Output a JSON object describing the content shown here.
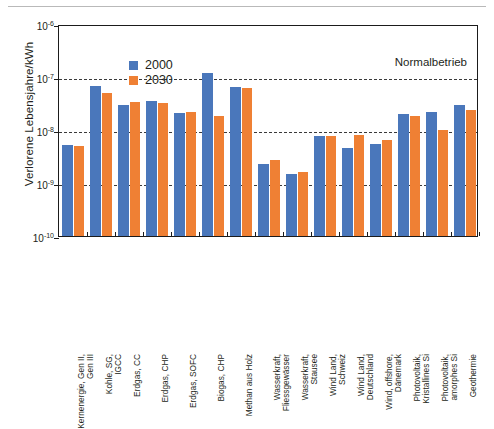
{
  "figure": {
    "annotation": "Normalbetrieb",
    "y_axis_title": "Verlorene Lebensjahre/kWh",
    "colors": {
      "series_2000": "#4a77bb",
      "series_2030": "#ef8034",
      "axis": "#1b1b1b",
      "grid": "#3a3a3a"
    }
  },
  "legend": {
    "position": "top-left",
    "entries": [
      {
        "label": "2000",
        "color": "#4a77bb"
      },
      {
        "label": "2030",
        "color": "#ef8034"
      }
    ]
  },
  "y_ticks": [
    {
      "label": "10",
      "exp": "-6",
      "value": 1e-06
    },
    {
      "label": "10",
      "exp": "-7",
      "value": 1e-07
    },
    {
      "label": "10",
      "exp": "-8",
      "value": 1e-08
    },
    {
      "label": "10",
      "exp": "-9",
      "value": 1e-09
    },
    {
      "label": "10",
      "exp": "-10",
      "value": 1e-10
    }
  ],
  "chart_data": {
    "type": "bar",
    "title": "",
    "subtitle": "",
    "annotation": "Normalbetrieb",
    "xlabel": "",
    "ylabel": "Verlorene Lebensjahre/kWh",
    "yscale": "log",
    "ylim": [
      1e-10,
      1e-06
    ],
    "grid": true,
    "legend_position": "top-left",
    "categories": [
      "Kernenergie, Gen II, Gen III",
      "Kohle, SG, IGCC",
      "Erdgas, CC",
      "Erdgas, CHP",
      "Erdgas, SOFC",
      "Biogas, CHP",
      "Methan aus Holz",
      "Wasserkraft, Fliessgewässer",
      "Wasserkraft, Stausee",
      "Wind Land, Schweiz",
      "Wind Land, Deutschland",
      "Wind, offshore, Dänemark",
      "Photovoltaik, Kristallines Si",
      "Photovoltaik, amorphes Si",
      "Geothermie"
    ],
    "category_lines": [
      [
        "Kernenergie, Gen II,",
        "Gen III"
      ],
      [
        "Kohle, SG,",
        "IGCC"
      ],
      [
        "Erdgas, CC"
      ],
      [
        "Erdgas, CHP"
      ],
      [
        "Erdgas, SOFC"
      ],
      [
        "Biogas, CHP"
      ],
      [
        "Methan aus Holz"
      ],
      [
        "Wasserkraft,",
        "Fliessgewässer"
      ],
      [
        "Wasserkraft,",
        "Stausee"
      ],
      [
        "Wind Land,",
        "Schweiz"
      ],
      [
        "Wind Land,",
        "Deutschland"
      ],
      [
        "Wind, offshore,",
        "Dänemark"
      ],
      [
        "Photovoltaik,",
        "Kristallines Si"
      ],
      [
        "Photovoltaik,",
        "amorphes Si"
      ],
      [
        "Geothermie"
      ]
    ],
    "series": [
      {
        "name": "2000",
        "color": "#4a77bb",
        "values": [
          5.3e-09,
          6.8e-08,
          3e-08,
          3.5e-08,
          2.1e-08,
          1.2e-07,
          6.6e-08,
          2.3e-09,
          1.45e-09,
          7.7e-09,
          4.5e-09,
          5.5e-09,
          2e-08,
          2.2e-08,
          3e-08
        ]
      },
      {
        "name": "2030",
        "color": "#ef8034",
        "values": [
          5e-09,
          5.1e-08,
          3.4e-08,
          3.2e-08,
          2.2e-08,
          1.8e-08,
          6.3e-08,
          2.7e-09,
          1.6e-09,
          7.6e-09,
          8e-09,
          6.5e-09,
          1.8e-08,
          1e-08,
          2.4e-08
        ]
      }
    ]
  }
}
